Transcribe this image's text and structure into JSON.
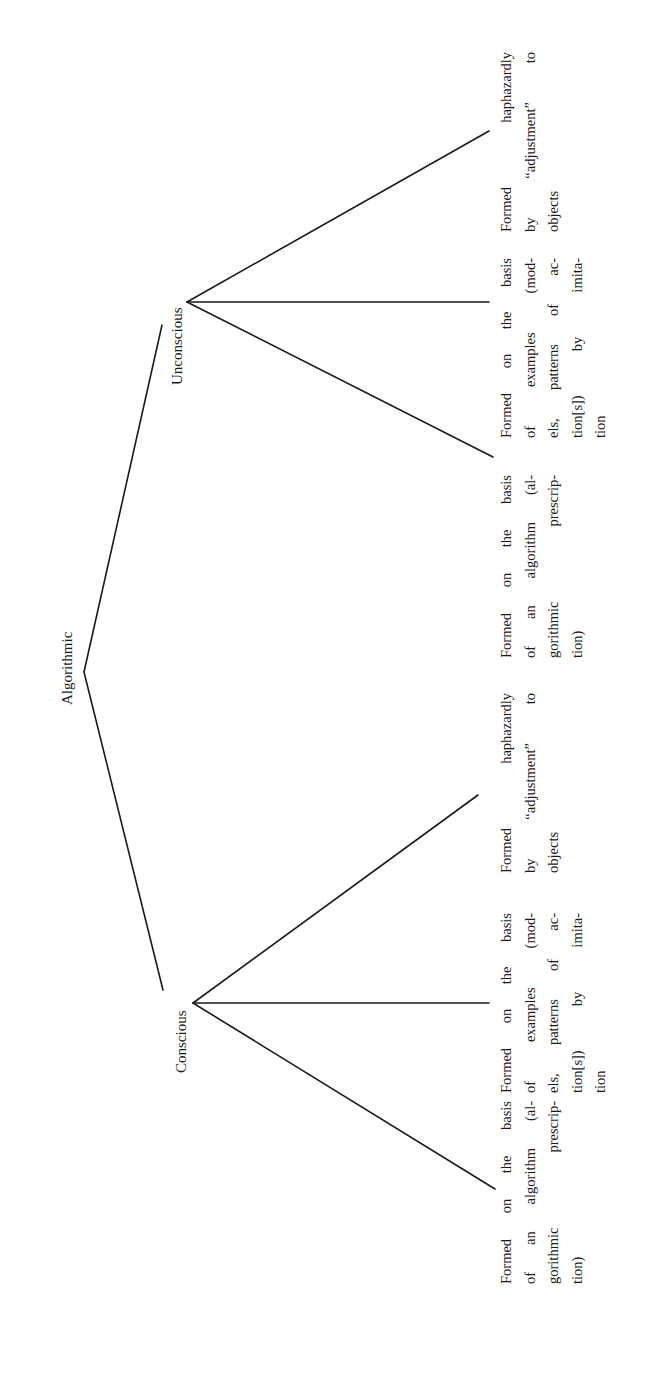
{
  "diagram": {
    "orientation": "rotated-90-ccw",
    "root": {
      "label": "Algorithmic"
    },
    "branches": [
      {
        "label": "Unconscious",
        "leaves": [
          {
            "lines": [
              "Formed on the basis",
              "of an algorithm (al-",
              "gorithmic prescrip-",
              "tion)"
            ]
          },
          {
            "lines": [
              "Formed on the basis",
              "of examples (mod-",
              "els, patterns of ac-",
              "tion[s]) by imita-",
              "tion"
            ]
          },
          {
            "lines": [
              "Formed haphazardly",
              "by “adjustment” to",
              "objects"
            ]
          }
        ]
      },
      {
        "label": "Conscious",
        "leaves": [
          {
            "lines": [
              "Formed on the basis",
              "of an algorithm (al-",
              "gorithmic prescrip-",
              "tion)"
            ]
          },
          {
            "lines": [
              "Formed on the basis",
              "of examples (mod-",
              "els, patterns of ac-",
              "tion[s]) by imita-",
              "tion"
            ]
          },
          {
            "lines": [
              "Formed haphazardly",
              "by “adjustment” to",
              "objects"
            ]
          }
        ]
      }
    ]
  }
}
